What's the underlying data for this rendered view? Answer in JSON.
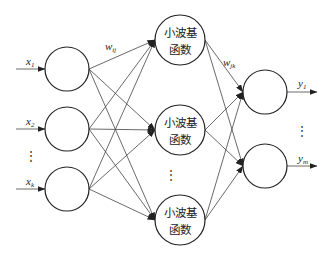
{
  "diagram": {
    "title": "",
    "layers": {
      "input": {
        "nodes": [
          {
            "label": "x",
            "sub": "1"
          },
          {
            "label": "x",
            "sub": "2"
          },
          {
            "label": "x",
            "sub": "k"
          }
        ],
        "ellipsis": "⋮"
      },
      "hidden": {
        "nodes": [
          {
            "line1": "小波基",
            "line2": "函数"
          },
          {
            "line1": "小波基",
            "line2": "函数"
          },
          {
            "line1": "小波基",
            "line2": "函数"
          }
        ],
        "ellipsis": "⋮"
      },
      "output": {
        "nodes": [
          {
            "label": "y",
            "sub": "1"
          },
          {
            "label": "y",
            "sub": "m"
          }
        ],
        "ellipsis": "⋮"
      }
    },
    "weights": {
      "input_hidden": {
        "label": "w",
        "sub": "ij"
      },
      "hidden_output": {
        "label": "w",
        "sub": "jk"
      }
    },
    "colors": {
      "stroke": "#222222",
      "background": "#ffffff"
    }
  }
}
